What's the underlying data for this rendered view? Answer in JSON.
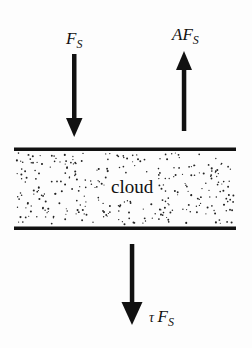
{
  "diagram": {
    "type": "radiative-flux-through-cloud",
    "layer": {
      "label": "cloud",
      "fill": "stippled",
      "boundary_color": "#111111"
    },
    "arrows": [
      {
        "id": "incident",
        "direction": "down",
        "symbol": "F",
        "subscript": "S",
        "prefix": ""
      },
      {
        "id": "reflected",
        "direction": "up",
        "symbol": "F",
        "subscript": "S",
        "prefix": "A"
      },
      {
        "id": "transmitted",
        "direction": "down",
        "symbol": "F",
        "subscript": "S",
        "prefix": "τ "
      }
    ]
  },
  "labels": {
    "incident": {
      "prefix": "",
      "main": "F",
      "sub": "S"
    },
    "reflected": {
      "prefix": "A",
      "main": "F",
      "sub": "S"
    },
    "transmitted": {
      "prefix": "τ ",
      "main": "F",
      "sub": "S"
    },
    "cloud": "cloud"
  },
  "colors": {
    "ink": "#111111",
    "background": "#fdfdfd"
  }
}
